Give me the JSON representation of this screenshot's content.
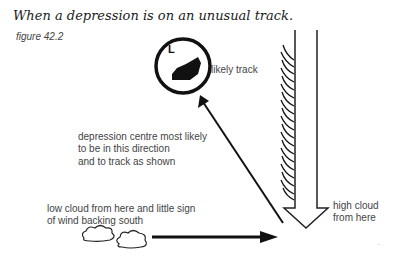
{
  "title": "When a depression is on an unusual track.",
  "figure_label": "figure 42.2",
  "circle": {
    "symbol": "L",
    "label": "likely track"
  },
  "labels": {
    "depression_centre": [
      "depression centre most likely",
      "to be in this direction",
      "and to track as shown"
    ],
    "low_cloud": [
      "low cloud from here and little sign",
      "of wind backing south"
    ],
    "high_cloud": [
      "high cloud",
      "from here"
    ]
  },
  "icons": [
    "low-pressure-circle-icon",
    "cloud-icon",
    "cirrus-streaks-icon",
    "hollow-down-arrow-icon",
    "arrow-right-icon",
    "arrow-up-left-icon"
  ]
}
